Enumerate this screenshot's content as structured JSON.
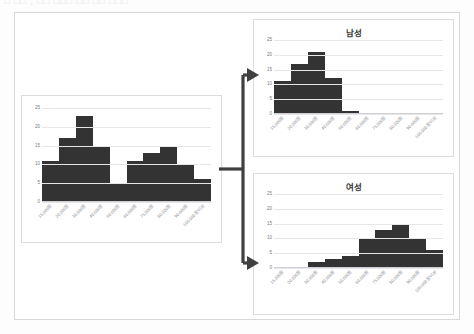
{
  "top_strip": {
    "text": "□ □□ , □□ □□□ □□ □□ □□□"
  },
  "categories": [
    "15,000원",
    "20,000원",
    "30,000원",
    "40,000원",
    "50,000원",
    "60,000원",
    "75,000원",
    "80,000원",
    "90,000원",
    "100,000원 이상"
  ],
  "y_ticks": [
    25,
    20,
    15,
    10,
    5,
    0
  ],
  "colors": {
    "bar": "#333333",
    "grid": "#e6e6ea",
    "panel_border": "#dcdce0",
    "frame_border": "#d8d8dc",
    "arrow": "#404040",
    "background": "#ffffff"
  },
  "charts": {
    "total": {
      "title": "",
      "values": [
        11,
        17,
        23,
        15,
        5,
        11,
        13,
        15,
        10,
        6
      ]
    },
    "male": {
      "title": "남성",
      "values": [
        11,
        17,
        21,
        12,
        1,
        0,
        0,
        0,
        0,
        0
      ]
    },
    "female": {
      "title": "여성",
      "values": [
        0,
        0,
        2,
        3,
        4,
        10,
        13,
        15,
        10,
        6
      ]
    }
  },
  "chart_data": [
    {
      "type": "bar",
      "title": "",
      "xlabel": "",
      "ylabel": "",
      "ylim": [
        0,
        25
      ],
      "grid": true,
      "legend": "none",
      "categories": [
        "15,000원",
        "20,000원",
        "30,000원",
        "40,000원",
        "50,000원",
        "60,000원",
        "75,000원",
        "80,000원",
        "90,000원",
        "100,000원 이상"
      ],
      "values": [
        11,
        17,
        23,
        15,
        5,
        11,
        13,
        15,
        10,
        6
      ],
      "tick_labels_y": [
        "0",
        "5",
        "10",
        "15",
        "20",
        "25"
      ]
    },
    {
      "type": "bar",
      "title": "남성",
      "xlabel": "",
      "ylabel": "",
      "ylim": [
        0,
        25
      ],
      "grid": true,
      "legend": "none",
      "categories": [
        "15,000원",
        "20,000원",
        "30,000원",
        "40,000원",
        "50,000원",
        "60,000원",
        "75,000원",
        "80,000원",
        "90,000원",
        "100,000원 이상"
      ],
      "values": [
        11,
        17,
        21,
        12,
        1,
        0,
        0,
        0,
        0,
        0
      ],
      "tick_labels_y": [
        "0",
        "5",
        "10",
        "15",
        "20",
        "25"
      ]
    },
    {
      "type": "bar",
      "title": "여성",
      "xlabel": "",
      "ylabel": "",
      "ylim": [
        0,
        25
      ],
      "grid": true,
      "legend": "none",
      "categories": [
        "15,000원",
        "20,000원",
        "30,000원",
        "40,000원",
        "50,000원",
        "60,000원",
        "75,000원",
        "80,000원",
        "90,000원",
        "100,000원 이상"
      ],
      "values": [
        0,
        0,
        2,
        3,
        4,
        10,
        13,
        15,
        10,
        6
      ],
      "tick_labels_y": [
        "0",
        "5",
        "10",
        "15",
        "20",
        "25"
      ]
    }
  ]
}
